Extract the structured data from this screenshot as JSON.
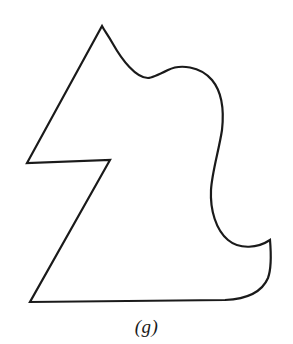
{
  "figure": {
    "caption": "(g)",
    "label_letter": "g",
    "background_color": "#ffffff",
    "stroke_color": "#1a1a1a",
    "stroke_width": 2.2,
    "fill_color": "none",
    "width": 293,
    "height": 344,
    "shape_name": "irregular-closed-curve-outline",
    "outline_path": "M 102 26 L 27 163 L 110 160 L 30 302 L 225 300 C 248 299 262 292 268 278 C 272 267 271 252 270 240 C 258 248 240 250 228 240 C 216 230 210 210 211 190 C 212 172 219 150 222 130 C 224 112 222 92 212 80 C 200 66 180 64 168 70 C 158 75 152 78 148 78 C 136 78 122 60 113 44 C 108 35 104 30 102 26 Z",
    "vertices": [
      {
        "name": "top-peak",
        "x": 102,
        "y": 26
      },
      {
        "name": "left-notch-outer",
        "x": 27,
        "y": 163
      },
      {
        "name": "left-notch-inner",
        "x": 110,
        "y": 160
      },
      {
        "name": "bottom-left-corner",
        "x": 30,
        "y": 302
      },
      {
        "name": "bottom-edge-right-end",
        "x": 225,
        "y": 300
      },
      {
        "name": "right-cusp",
        "x": 270,
        "y": 240
      },
      {
        "name": "right-pinch",
        "x": 211,
        "y": 190
      },
      {
        "name": "right-bulge-max",
        "x": 222,
        "y": 130
      },
      {
        "name": "wave-trough",
        "x": 148,
        "y": 78
      }
    ]
  }
}
